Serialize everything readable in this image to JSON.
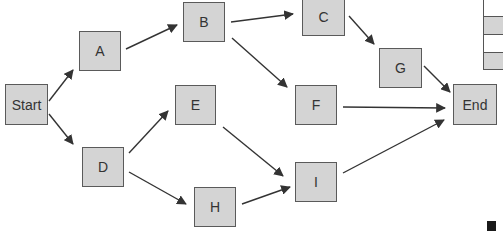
{
  "diagram": {
    "type": "flowchart",
    "colors": {
      "node_fill": "#d4d4d4",
      "node_border": "#5a5a5a",
      "edge": "#333333",
      "text": "#333333"
    },
    "nodes": [
      {
        "id": "start",
        "label": "Start",
        "x": 5,
        "y": 84,
        "w": 43,
        "h": 41
      },
      {
        "id": "a",
        "label": "A",
        "x": 79,
        "y": 31,
        "w": 42,
        "h": 40
      },
      {
        "id": "b",
        "label": "B",
        "x": 183,
        "y": 2,
        "w": 42,
        "h": 40
      },
      {
        "id": "c",
        "label": "C",
        "x": 302,
        "y": -2,
        "w": 43,
        "h": 38
      },
      {
        "id": "g",
        "label": "G",
        "x": 379,
        "y": 48,
        "w": 43,
        "h": 40
      },
      {
        "id": "end",
        "label": "End",
        "x": 453,
        "y": 84,
        "w": 44,
        "h": 41
      },
      {
        "id": "e",
        "label": "E",
        "x": 175,
        "y": 85,
        "w": 41,
        "h": 40
      },
      {
        "id": "f",
        "label": "F",
        "x": 295,
        "y": 85,
        "w": 42,
        "h": 40
      },
      {
        "id": "d",
        "label": "D",
        "x": 82,
        "y": 147,
        "w": 42,
        "h": 40
      },
      {
        "id": "h",
        "label": "H",
        "x": 194,
        "y": 187,
        "w": 42,
        "h": 40
      },
      {
        "id": "i",
        "label": "I",
        "x": 295,
        "y": 162,
        "w": 42,
        "h": 40
      }
    ],
    "edges": [
      {
        "from": "start",
        "to": "a",
        "x1": 49,
        "y1": 101,
        "x2": 73,
        "y2": 70
      },
      {
        "from": "start",
        "to": "d",
        "x1": 49,
        "y1": 114,
        "x2": 73,
        "y2": 144
      },
      {
        "from": "a",
        "to": "b",
        "x1": 126,
        "y1": 49,
        "x2": 177,
        "y2": 25
      },
      {
        "from": "b",
        "to": "c",
        "x1": 231,
        "y1": 22,
        "x2": 293,
        "y2": 14
      },
      {
        "from": "b",
        "to": "f",
        "x1": 232,
        "y1": 38,
        "x2": 287,
        "y2": 87
      },
      {
        "from": "c",
        "to": "g",
        "x1": 349,
        "y1": 16,
        "x2": 374,
        "y2": 44
      },
      {
        "from": "g",
        "to": "end",
        "x1": 424,
        "y1": 66,
        "x2": 450,
        "y2": 92
      },
      {
        "from": "f",
        "to": "end",
        "x1": 343,
        "y1": 107,
        "x2": 445,
        "y2": 108
      },
      {
        "from": "d",
        "to": "e",
        "x1": 129,
        "y1": 153,
        "x2": 168,
        "y2": 111
      },
      {
        "from": "d",
        "to": "h",
        "x1": 129,
        "y1": 172,
        "x2": 186,
        "y2": 204
      },
      {
        "from": "e",
        "to": "i",
        "x1": 223,
        "y1": 127,
        "x2": 283,
        "y2": 176
      },
      {
        "from": "h",
        "to": "i",
        "x1": 242,
        "y1": 204,
        "x2": 290,
        "y2": 187
      },
      {
        "from": "i",
        "to": "end",
        "x1": 343,
        "y1": 173,
        "x2": 444,
        "y2": 120
      }
    ]
  }
}
